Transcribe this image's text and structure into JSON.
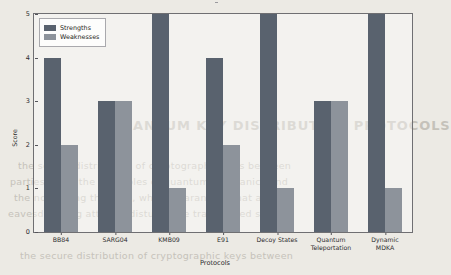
{
  "chart_data": {
    "type": "bar",
    "title": "",
    "xlabel": "Protocols",
    "ylabel": "Score",
    "ylim": [
      0,
      5
    ],
    "yticks": [
      "0",
      "1",
      "2",
      "3",
      "4",
      "5"
    ],
    "grid": false,
    "legend_position": "upper-left",
    "categories": [
      "BB84",
      "SARG04",
      "KMB09",
      "E91",
      "Decoy States",
      "Quantum\nTeleportation",
      "Dynamic MDKA"
    ],
    "series": [
      {
        "name": "Strengths",
        "color": "#59626e",
        "values": [
          4,
          3,
          5,
          4,
          5,
          3,
          5
        ]
      },
      {
        "name": "Weaknesses",
        "color": "#8d939b",
        "values": [
          2,
          3,
          1,
          2,
          1,
          3,
          1
        ]
      }
    ]
  },
  "legend": {
    "items": [
      {
        "label": "Strengths"
      },
      {
        "label": "Weaknesses"
      }
    ]
  },
  "background_bleed": {
    "heading": "QUANTUM KEY DISTRIBUTION PROTOCOLS",
    "lines": [
      "the secure distribution of cryptographic keys between",
      "parties using the principles of quantum mechanics and",
      "the no-cloning theorem, which guarantees that any",
      "eavesdropping attempt disturbs the transmitted states"
    ]
  }
}
